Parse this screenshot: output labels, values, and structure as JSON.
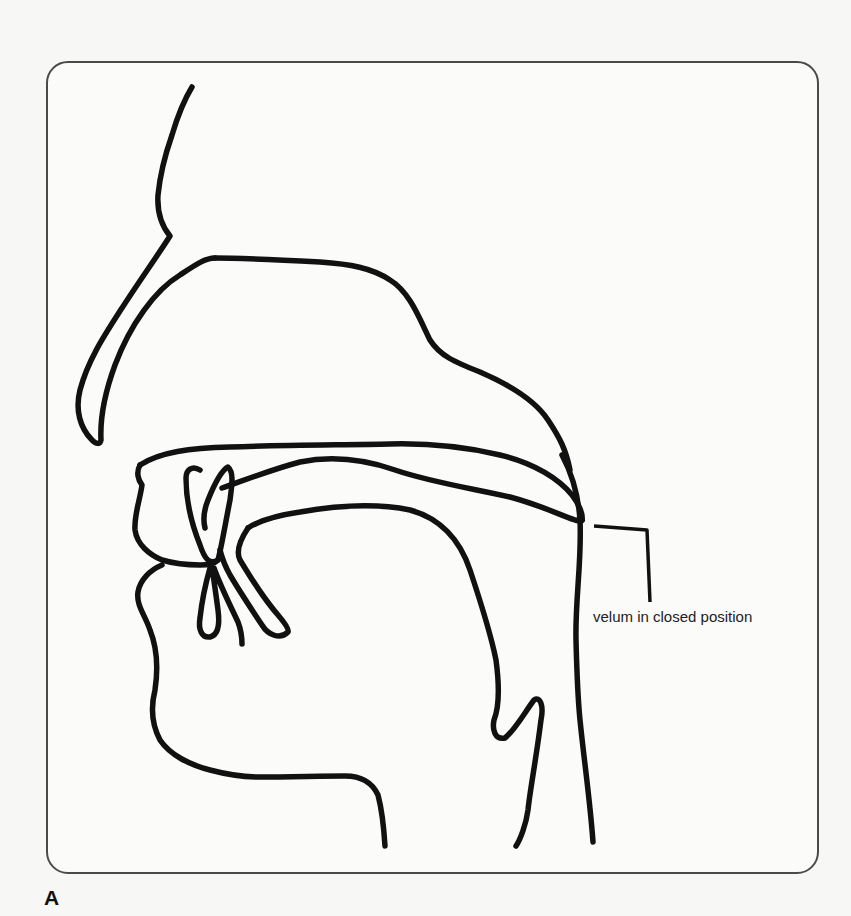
{
  "figure": {
    "panel_label": "A",
    "annotations": [
      {
        "id": "velum",
        "text": "velum in closed position"
      }
    ],
    "structures": [
      "nose-outline",
      "nasal-cavity",
      "hard-palate",
      "velum",
      "tongue",
      "upper-lip",
      "lower-lip",
      "upper-teeth",
      "lower-teeth",
      "chin-jaw",
      "epiglottis-larynx",
      "pharyngeal-wall"
    ],
    "colors": {
      "stroke": "#111111",
      "frame": "#4a4a4a",
      "background": "#f7f7f5"
    }
  }
}
